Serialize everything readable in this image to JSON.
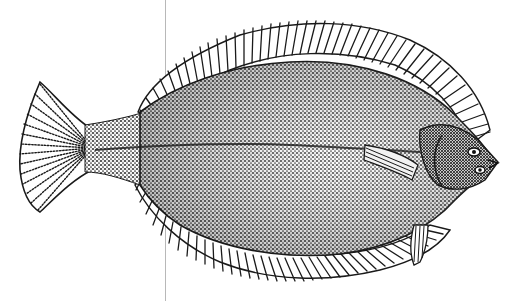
{
  "image": {
    "subject": "flounder-engraving",
    "description": "Black and white stippled engraving of a flatfish (flounder) facing right",
    "background": "#ffffff",
    "ink": "#1a1a1a"
  },
  "divider": {
    "x": 165,
    "color": "#b8b8b8"
  }
}
